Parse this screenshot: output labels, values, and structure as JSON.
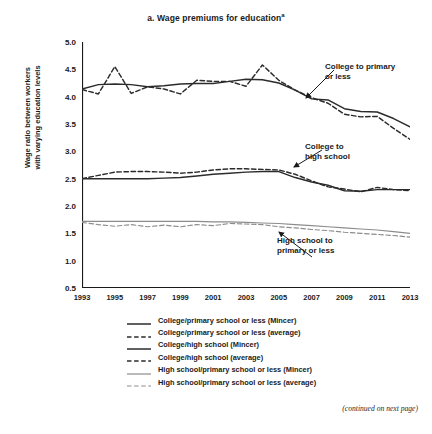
{
  "chart_data": {
    "type": "line",
    "title": "a. Wage premiums for education",
    "title_superscript": "a",
    "xlabel": "",
    "ylabel": "Wage ratio between workers with varying education levels",
    "ylabel_line1": "Wage ratio between workers",
    "ylabel_line2": "with varying education levels",
    "xlim": [
      1993,
      2013
    ],
    "ylim": [
      0.5,
      5.0
    ],
    "ytick_step": 0.5,
    "xtick_step": 2,
    "grid": false,
    "legend_position": "below-plot",
    "yticks": [
      "5.0",
      "4.5",
      "4.0",
      "3.5",
      "3.0",
      "2.5",
      "2.0",
      "1.5",
      "1.0",
      "0.5"
    ],
    "xticks": [
      "1993",
      "1995",
      "1997",
      "1999",
      "2001",
      "2003",
      "2005",
      "2007",
      "2009",
      "2011",
      "2013"
    ],
    "x": [
      1993,
      1994,
      1995,
      1996,
      1997,
      1998,
      1999,
      2000,
      2001,
      2002,
      2003,
      2004,
      2005,
      2006,
      2007,
      2008,
      2009,
      2010,
      2011,
      2012,
      2013
    ],
    "series": [
      {
        "name": "College/primary school or less (Mincer)",
        "style": "solid",
        "color": "#2b2b2b",
        "values": [
          4.14,
          4.22,
          4.23,
          4.22,
          4.18,
          4.2,
          4.23,
          4.24,
          4.24,
          4.28,
          4.32,
          4.31,
          4.25,
          4.12,
          3.96,
          3.94,
          3.78,
          3.73,
          3.72,
          3.6,
          3.45
        ]
      },
      {
        "name": "College/primary school or less (average)",
        "style": "dashed",
        "color": "#2b2b2b",
        "values": [
          4.13,
          4.05,
          4.55,
          4.06,
          4.18,
          4.14,
          4.05,
          4.3,
          4.28,
          4.28,
          4.19,
          4.58,
          4.3,
          4.12,
          3.98,
          3.88,
          3.68,
          3.63,
          3.64,
          3.42,
          3.22
        ]
      },
      {
        "name": "College/high school (Mincer)",
        "style": "solid",
        "color": "#2b2b2b",
        "values": [
          2.5,
          2.5,
          2.5,
          2.5,
          2.5,
          2.51,
          2.52,
          2.55,
          2.58,
          2.6,
          2.62,
          2.63,
          2.63,
          2.52,
          2.44,
          2.38,
          2.28,
          2.27,
          2.3,
          2.3,
          2.3
        ]
      },
      {
        "name": "College/high school (average)",
        "style": "dashed",
        "color": "#2b2b2b",
        "values": [
          2.5,
          2.56,
          2.62,
          2.63,
          2.63,
          2.62,
          2.6,
          2.62,
          2.66,
          2.68,
          2.68,
          2.67,
          2.66,
          2.58,
          2.46,
          2.35,
          2.31,
          2.26,
          2.34,
          2.3,
          2.28
        ]
      },
      {
        "name": "High school/primary school or less (Mincer)",
        "style": "solid",
        "color": "#8c8c8c",
        "values": [
          1.72,
          1.72,
          1.72,
          1.72,
          1.72,
          1.72,
          1.72,
          1.72,
          1.71,
          1.71,
          1.7,
          1.69,
          1.68,
          1.66,
          1.64,
          1.62,
          1.6,
          1.58,
          1.56,
          1.53,
          1.5
        ]
      },
      {
        "name": "High school/primary school or less (average)",
        "style": "dashed",
        "color": "#8c8c8c",
        "values": [
          1.7,
          1.66,
          1.63,
          1.66,
          1.62,
          1.65,
          1.62,
          1.66,
          1.64,
          1.68,
          1.67,
          1.66,
          1.62,
          1.6,
          1.57,
          1.55,
          1.52,
          1.5,
          1.48,
          1.46,
          1.43
        ]
      }
    ],
    "annotations": [
      {
        "id": "college-primary",
        "text_line1": "College to primary",
        "text_line2": "or less"
      },
      {
        "id": "college-high",
        "text_line1": "College to",
        "text_line2": "high school"
      },
      {
        "id": "high-primary",
        "text_line1": "High school to",
        "text_line2": "primary or less"
      }
    ]
  },
  "legend": {
    "items": [
      {
        "label": "College/primary school or less (Mincer)",
        "style": "solid",
        "color": "#2b2b2b"
      },
      {
        "label": "College/primary school or less (average)",
        "style": "dashed",
        "color": "#2b2b2b"
      },
      {
        "label": "College/high school (Mincer)",
        "style": "solid",
        "color": "#2b2b2b"
      },
      {
        "label": "College/high school (average)",
        "style": "dashed",
        "color": "#2b2b2b"
      },
      {
        "label": "High school/primary school or less (Mincer)",
        "style": "solid",
        "color": "#8c8c8c"
      },
      {
        "label": "High school/primary school or less (average)",
        "style": "dashed",
        "color": "#8c8c8c"
      }
    ]
  },
  "footnote": "(continued on next page)"
}
